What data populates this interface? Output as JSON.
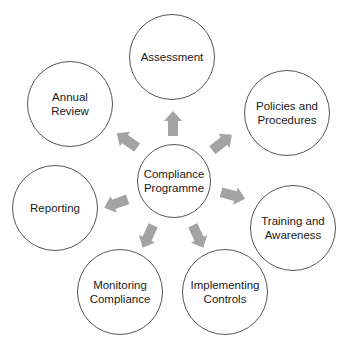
{
  "diagram": {
    "type": "hub-and-spoke",
    "center": {
      "label": "Compliance\nProgramme",
      "cx": 174,
      "cy": 181,
      "r": 37
    },
    "nodes": [
      {
        "id": "assessment",
        "label": "Assessment",
        "cx": 172,
        "cy": 57,
        "r": 43
      },
      {
        "id": "policies",
        "label": "Policies and\nProcedures",
        "cx": 287,
        "cy": 113,
        "r": 43
      },
      {
        "id": "training",
        "label": "Training and\nAwareness",
        "cx": 293,
        "cy": 228,
        "r": 43
      },
      {
        "id": "implementing",
        "label": "Implementing\nControls",
        "cx": 225,
        "cy": 292,
        "r": 43
      },
      {
        "id": "monitoring",
        "label": "Monitoring\nCompliance",
        "cx": 120,
        "cy": 292,
        "r": 43
      },
      {
        "id": "reporting",
        "label": "Reporting",
        "cx": 55,
        "cy": 208,
        "r": 43
      },
      {
        "id": "annual-review",
        "label": "Annual Review",
        "cx": 70,
        "cy": 104,
        "r": 43
      }
    ],
    "arrows": [
      {
        "to": "assessment",
        "cx": 173,
        "cy": 123,
        "angle": 0
      },
      {
        "to": "policies",
        "cx": 222,
        "cy": 142,
        "angle": 52
      },
      {
        "to": "training",
        "cx": 233,
        "cy": 195,
        "angle": 105
      },
      {
        "to": "implementing",
        "cx": 198,
        "cy": 236,
        "angle": 155
      },
      {
        "to": "monitoring",
        "cx": 148,
        "cy": 236,
        "angle": 205
      },
      {
        "to": "reporting",
        "cx": 116,
        "cy": 203,
        "angle": 250
      },
      {
        "to": "annual-review",
        "cx": 127,
        "cy": 140,
        "angle": 305
      }
    ],
    "colors": {
      "arrow": "#a3a3a3",
      "circle_stroke": "#555555",
      "text": "#1a1a1a",
      "background": "#ffffff"
    }
  }
}
